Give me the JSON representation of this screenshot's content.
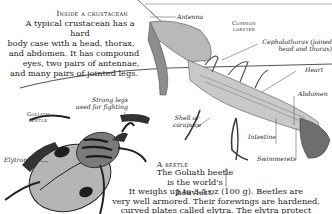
{
  "crustacean_section": {
    "heading": "Inside a crustacean",
    "body_lines": [
      "A typical crustacean has a hard",
      "body case with a head, thorax,",
      "and abdomen. It has compound",
      "eyes, two pairs of antennae,",
      "and many pairs of jointed legs."
    ]
  },
  "lobster": {
    "caption_line1": "Common",
    "caption_line2": "lobster",
    "labels": {
      "antenna": "Antenna",
      "cephalothorax_line1": "Cephalothorax (joined",
      "cephalothorax_line2": "head and thorax)",
      "heart": "Heart",
      "abdomen": "Abdomen",
      "shell_line1": "Shell or",
      "shell_line2": "carapace",
      "intestine": "Intestine",
      "swimmerets": "Swimmerets"
    }
  },
  "beetle": {
    "caption_line1": "Goliath",
    "caption_line2": "beetle",
    "labels": {
      "strong_legs_line1": "Strong legs",
      "strong_legs_line2": "used for fighting",
      "elytron": "Elytron"
    }
  },
  "beetle_section": {
    "heading": "A beetle",
    "body_lines": [
      "The Goliath beetle",
      "is the world's heaviest.",
      "It weighs up to 3.5 oz (100 g). Beetles are",
      "very well armored. Their forewings are hardened,",
      "curved plates called elytra. The elytra protect"
    ]
  },
  "colors": {
    "background": "#ffffff",
    "text": "#1b1b1b",
    "illustration_dark": "#2a2a2a",
    "illustration_mid": "#8a8a8a",
    "illustration_light": "#cfcfcf"
  }
}
